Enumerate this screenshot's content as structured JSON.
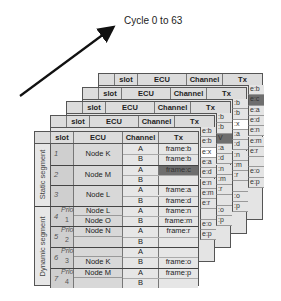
{
  "title": "Cycle 0 to 63",
  "header": {
    "seg": "",
    "slot": "slot",
    "ecu": "ECU",
    "channel": "Channel",
    "tx": "Tx"
  },
  "segments": {
    "static": "Static segment",
    "dynamic": "Dynamic segment"
  },
  "rows": [
    {
      "slot": "1",
      "prio": "",
      "prio_num": "",
      "ecu": [
        "Node K"
      ],
      "channels": [
        {
          "ch": "A",
          "tx": "frame:b",
          "style": ""
        },
        {
          "ch": "B",
          "tx": "frame:b",
          "style": ""
        }
      ]
    },
    {
      "slot": "2",
      "prio": "",
      "prio_num": "",
      "ecu": [
        "Node M"
      ],
      "channels": [
        {
          "ch": "A",
          "tx": "frame:c",
          "style": "dark"
        },
        {
          "ch": "B",
          "tx": "",
          "style": ""
        }
      ]
    },
    {
      "slot": "3",
      "prio": "",
      "prio_num": "",
      "ecu": [
        "Node L"
      ],
      "channels": [
        {
          "ch": "A",
          "tx": "frame:a",
          "style": ""
        },
        {
          "ch": "B",
          "tx": "frame:d",
          "style": ""
        }
      ]
    },
    {
      "slot": "4",
      "prio": "Prio",
      "prio_num": "1",
      "ecu": [
        "Node L",
        "Node O"
      ],
      "channels": [
        {
          "ch": "A",
          "tx": "frame:n",
          "style": ""
        },
        {
          "ch": "B",
          "tx": "frame:m",
          "style": ""
        }
      ]
    },
    {
      "slot": "5",
      "prio": "Prio",
      "prio_num": "2",
      "ecu": [
        "Node N",
        ""
      ],
      "channels": [
        {
          "ch": "A",
          "tx": "frame:r",
          "style": ""
        },
        {
          "ch": "B",
          "tx": "",
          "style": ""
        }
      ]
    },
    {
      "slot": "6",
      "prio": "Prio",
      "prio_num": "3",
      "ecu": [
        "",
        "Node K"
      ],
      "channels": [
        {
          "ch": "A",
          "tx": "",
          "style": ""
        },
        {
          "ch": "B",
          "tx": "frame:o",
          "style": ""
        }
      ]
    },
    {
      "slot": "7",
      "prio": "Prio",
      "prio_num": "4",
      "ecu": [
        "Node M",
        ""
      ],
      "channels": [
        {
          "ch": "A",
          "tx": "frame:p",
          "style": ""
        },
        {
          "ch": "B",
          "tx": "",
          "style": ""
        }
      ]
    }
  ],
  "back_tables_tx_fragments": [
    [
      "e:b",
      "e:b",
      "e:x",
      "e:a",
      "e:d",
      "e:n",
      "e:m",
      "e:r",
      "",
      "e:o",
      "e:p"
    ],
    [
      ":b",
      ":b",
      "V",
      ":a",
      ":d",
      ":n",
      ":m",
      ":r",
      "",
      ":o",
      ":p"
    ],
    [
      ":b",
      ":b",
      ":x",
      ":a",
      ":d",
      ":n",
      ":m",
      ":r",
      "",
      ":o",
      ":p"
    ],
    [
      "e:b",
      "e:c",
      "e:a",
      "e:d",
      "e:n",
      "e:m",
      "e:r",
      "",
      "e:o",
      "e:p"
    ]
  ]
}
